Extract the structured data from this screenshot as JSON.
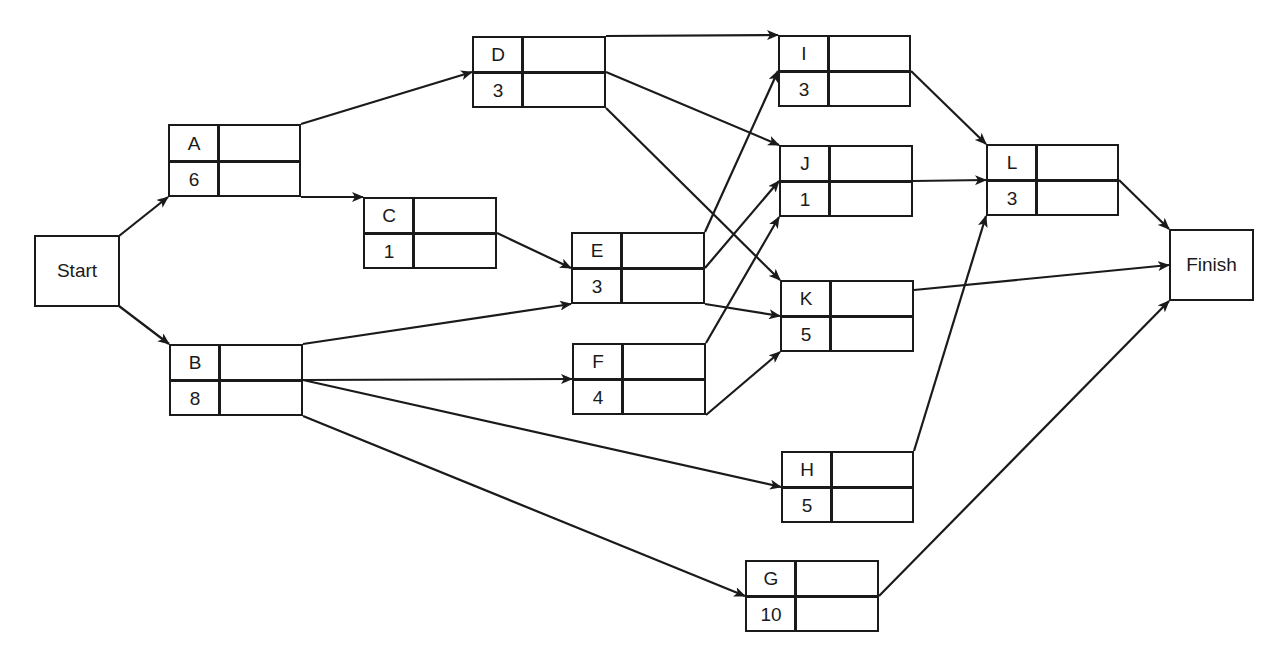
{
  "diagram": {
    "type": "activity-on-node network",
    "start": {
      "label": "Start",
      "x": 34,
      "y": 235,
      "w": 86,
      "h": 72
    },
    "finish": {
      "label": "Finish",
      "x": 1169,
      "y": 229,
      "w": 85,
      "h": 72
    },
    "activities": [
      {
        "id": "A",
        "duration": "6",
        "x": 168,
        "y": 124,
        "w": 133,
        "h": 73
      },
      {
        "id": "B",
        "duration": "8",
        "x": 169,
        "y": 344,
        "w": 134,
        "h": 72
      },
      {
        "id": "C",
        "duration": "1",
        "x": 363,
        "y": 197,
        "w": 134,
        "h": 72
      },
      {
        "id": "D",
        "duration": "3",
        "x": 472,
        "y": 36,
        "w": 134,
        "h": 72
      },
      {
        "id": "E",
        "duration": "3",
        "x": 571,
        "y": 232,
        "w": 134,
        "h": 72
      },
      {
        "id": "F",
        "duration": "4",
        "x": 572,
        "y": 343,
        "w": 134,
        "h": 72
      },
      {
        "id": "G",
        "duration": "10",
        "x": 745,
        "y": 560,
        "w": 134,
        "h": 72
      },
      {
        "id": "H",
        "duration": "5",
        "x": 781,
        "y": 451,
        "w": 133,
        "h": 72
      },
      {
        "id": "I",
        "duration": "3",
        "x": 778,
        "y": 35,
        "w": 133,
        "h": 72
      },
      {
        "id": "J",
        "duration": "1",
        "x": 779,
        "y": 145,
        "w": 134,
        "h": 72
      },
      {
        "id": "K",
        "duration": "5",
        "x": 780,
        "y": 280,
        "w": 134,
        "h": 72
      },
      {
        "id": "L",
        "duration": "3",
        "x": 986,
        "y": 144,
        "w": 133,
        "h": 72
      }
    ],
    "edges": [
      {
        "from": "Start",
        "to": "A",
        "x1": 119,
        "y1": 236,
        "x2": 168,
        "y2": 197
      },
      {
        "from": "Start",
        "to": "B",
        "x1": 119,
        "y1": 306,
        "x2": 169,
        "y2": 344
      },
      {
        "from": "A",
        "to": "D",
        "x1": 301,
        "y1": 124,
        "x2": 472,
        "y2": 72
      },
      {
        "from": "A",
        "to": "C",
        "x1": 301,
        "y1": 197,
        "x2": 363,
        "y2": 197
      },
      {
        "from": "C",
        "to": "E",
        "x1": 497,
        "y1": 233,
        "x2": 571,
        "y2": 268
      },
      {
        "from": "B",
        "to": "E",
        "x1": 303,
        "y1": 344,
        "x2": 571,
        "y2": 304
      },
      {
        "from": "B",
        "to": "F",
        "x1": 303,
        "y1": 380,
        "x2": 572,
        "y2": 379
      },
      {
        "from": "B",
        "to": "H",
        "x1": 303,
        "y1": 380,
        "x2": 781,
        "y2": 487
      },
      {
        "from": "B",
        "to": "G",
        "x1": 303,
        "y1": 416,
        "x2": 745,
        "y2": 596
      },
      {
        "from": "D",
        "to": "I",
        "x1": 606,
        "y1": 36,
        "x2": 778,
        "y2": 35
      },
      {
        "from": "D",
        "to": "J",
        "x1": 606,
        "y1": 72,
        "x2": 779,
        "y2": 145
      },
      {
        "from": "D",
        "to": "K",
        "x1": 606,
        "y1": 108,
        "x2": 780,
        "y2": 280
      },
      {
        "from": "E",
        "to": "I",
        "x1": 705,
        "y1": 232,
        "x2": 778,
        "y2": 71
      },
      {
        "from": "E",
        "to": "J",
        "x1": 705,
        "y1": 268,
        "x2": 779,
        "y2": 181
      },
      {
        "from": "E",
        "to": "K",
        "x1": 705,
        "y1": 304,
        "x2": 780,
        "y2": 316
      },
      {
        "from": "F",
        "to": "J",
        "x1": 706,
        "y1": 343,
        "x2": 779,
        "y2": 217
      },
      {
        "from": "F",
        "to": "K",
        "x1": 706,
        "y1": 415,
        "x2": 780,
        "y2": 352
      },
      {
        "from": "I",
        "to": "L",
        "x1": 911,
        "y1": 71,
        "x2": 986,
        "y2": 144
      },
      {
        "from": "J",
        "to": "L",
        "x1": 913,
        "y1": 181,
        "x2": 986,
        "y2": 180
      },
      {
        "from": "H",
        "to": "L",
        "x1": 914,
        "y1": 451,
        "x2": 986,
        "y2": 216
      },
      {
        "from": "L",
        "to": "Finish",
        "x1": 1119,
        "y1": 180,
        "x2": 1169,
        "y2": 229
      },
      {
        "from": "K",
        "to": "Finish",
        "x1": 914,
        "y1": 290,
        "x2": 1169,
        "y2": 265
      },
      {
        "from": "G",
        "to": "Finish",
        "x1": 879,
        "y1": 596,
        "x2": 1169,
        "y2": 301
      }
    ]
  },
  "colors": {
    "stroke": "#1a1a1a",
    "background": "#ffffff"
  }
}
